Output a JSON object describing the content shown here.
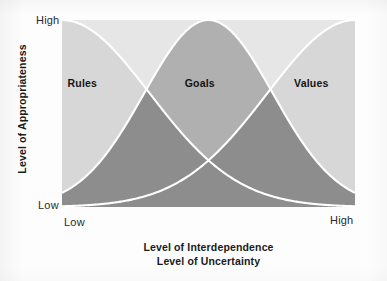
{
  "chart_data": {
    "type": "area",
    "title": "",
    "subtitle": "",
    "xlabel_lines": [
      "Level of Interdependence",
      "Level of Uncertainty"
    ],
    "ylabel": "Level of Appropriateness",
    "x_ticks": [
      "Low",
      "High"
    ],
    "y_ticks": [
      "Low",
      "High"
    ],
    "xlim": [
      0,
      1
    ],
    "ylim": [
      0,
      1
    ],
    "grid": false,
    "legend_position": "none",
    "annotations": [
      "Rules",
      "Goals",
      "Values"
    ],
    "series": [
      {
        "name": "Rules",
        "peak_x": 0.0,
        "peak_y": 1.0,
        "spread": 0.3,
        "label_x": 0.07,
        "label_y": 0.66,
        "fill": "#d8d8d8"
      },
      {
        "name": "Goals",
        "peak_x": 0.5,
        "peak_y": 1.0,
        "spread": 0.22,
        "label_x": 0.47,
        "label_y": 0.66,
        "fill": "#8d8d8d"
      },
      {
        "name": "Values",
        "peak_x": 1.0,
        "peak_y": 1.0,
        "spread": 0.3,
        "label_x": 0.85,
        "label_y": 0.66,
        "fill": "#d8d8d8"
      }
    ],
    "colors": {
      "plot_background": "#e6e6e6",
      "curve_stroke": "#ffffff",
      "fill_light": "#d8d8d8",
      "fill_mid": "#b2b2b2",
      "fill_dark": "#8d8d8d",
      "text": "#141414",
      "page_background": "#fdfdfd"
    }
  },
  "axes": {
    "y": {
      "title": "Level of Appropriateness",
      "high": "High",
      "low": "Low"
    },
    "x": {
      "title_line1": "Level of Interdependence",
      "title_line2": "Level of Uncertainty",
      "low": "Low",
      "high": "High"
    }
  },
  "regions": {
    "rules": "Rules",
    "goals": "Goals",
    "values": "Values"
  }
}
